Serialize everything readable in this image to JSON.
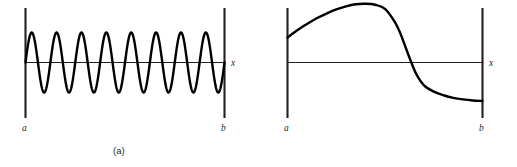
{
  "figure": {
    "background_color": "#ffffff",
    "stroke_color": "#000000",
    "axis_color": "#231f20",
    "panels": [
      {
        "id": "a",
        "caption": "(a)",
        "left_bound_label": "a",
        "right_bound_label": "b",
        "axis_label": "x"
      },
      {
        "id": "b",
        "caption": "(b)",
        "left_bound_label": "a",
        "right_bound_label": "b",
        "axis_label": "x"
      }
    ]
  },
  "chart_data": [
    {
      "type": "line",
      "id": "panel-a",
      "title": "(a)",
      "xlabel": "x",
      "ylabel": "",
      "grid": false,
      "legend": false,
      "annotations": [
        "a",
        "b",
        "x"
      ],
      "description": "High-frequency oscillatory function of constant amplitude on interval [a, b]",
      "xlim": [
        0,
        1
      ],
      "ylim": [
        -1.3,
        1.3
      ],
      "series": [
        {
          "name": "oscillation",
          "form": "amplitude * sin(2*pi*cycles*t)",
          "amplitude": 1.0,
          "cycles": 8,
          "phase": 0.0
        }
      ],
      "axis_y_value": 0
    },
    {
      "type": "line",
      "id": "panel-b",
      "title": "(b)",
      "xlabel": "x",
      "ylabel": "",
      "grid": false,
      "legend": false,
      "annotations": [
        "a",
        "b",
        "x"
      ],
      "description": "Smooth slowly varying function rising to a maximum then falling through zero to a negative plateau on interval [a, b]",
      "xlim": [
        0,
        1
      ],
      "ylim": [
        -1.3,
        1.3
      ],
      "series": [
        {
          "name": "smooth-curve",
          "x": [
            0.0,
            0.05,
            0.1,
            0.15,
            0.2,
            0.25,
            0.3,
            0.35,
            0.4,
            0.45,
            0.5,
            0.55,
            0.58,
            0.6,
            0.63,
            0.66,
            0.7,
            0.75,
            0.8,
            0.85,
            0.9,
            0.95,
            1.0
          ],
          "y": [
            0.48,
            0.62,
            0.74,
            0.85,
            0.94,
            1.02,
            1.08,
            1.12,
            1.13,
            1.11,
            1.03,
            0.78,
            0.55,
            0.35,
            0.05,
            -0.22,
            -0.44,
            -0.56,
            -0.63,
            -0.68,
            -0.71,
            -0.73,
            -0.74
          ]
        }
      ],
      "zero_crossing_x": 0.632,
      "peak_x": 0.4,
      "peak_y": 1.13,
      "axis_y_value": 0
    }
  ]
}
